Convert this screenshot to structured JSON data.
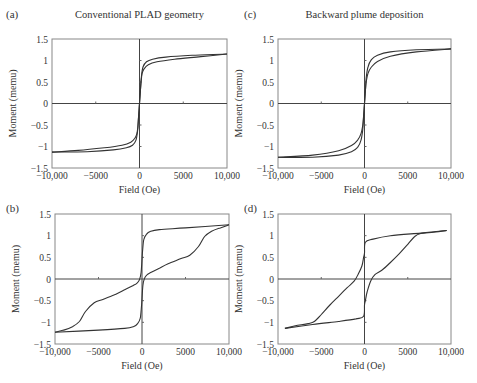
{
  "figure": {
    "panels": [
      {
        "id": "a",
        "letter": "(a)",
        "title": "Conventional PLAD geometry"
      },
      {
        "id": "c",
        "letter": "(c)",
        "title": "Backward plume deposition"
      },
      {
        "id": "b",
        "letter": "(b)",
        "title": ""
      },
      {
        "id": "d",
        "letter": "(d)",
        "title": ""
      }
    ]
  },
  "chart_data": [
    {
      "panel": "(a)",
      "type": "line",
      "title": "Conventional PLAD geometry",
      "xlabel": "Field (Oe)",
      "ylabel": "Moment (memu)",
      "xlim": [
        -10000,
        10000
      ],
      "ylim": [
        -1.5,
        1.5
      ],
      "x_ticks": [
        "-10,000",
        "-5000",
        "0",
        "5000",
        "10,000"
      ],
      "y_ticks": [
        "1.5",
        "1",
        "0.5",
        "0",
        "-0.5",
        "-1",
        "-1.5"
      ],
      "grid": false,
      "series": [
        {
          "name": "descending branch",
          "x": [
            10000,
            6000,
            3000,
            1500,
            800,
            400,
            200,
            100,
            0,
            -100,
            -200,
            -300,
            -500,
            -1000,
            -2000,
            -4000,
            -7000,
            -10000
          ],
          "y": [
            1.15,
            1.12,
            1.08,
            1.03,
            0.97,
            0.85,
            0.6,
            0.3,
            0.0,
            -0.3,
            -0.55,
            -0.7,
            -0.8,
            -0.9,
            -0.97,
            -1.03,
            -1.09,
            -1.13
          ]
        },
        {
          "name": "ascending branch",
          "x": [
            -10000,
            -6000,
            -3000,
            -1500,
            -800,
            -400,
            -200,
            -100,
            0,
            100,
            200,
            300,
            500,
            1000,
            2000,
            4000,
            7000,
            10000
          ],
          "y": [
            -1.13,
            -1.12,
            -1.08,
            -1.03,
            -0.97,
            -0.85,
            -0.6,
            -0.3,
            0.0,
            0.3,
            0.55,
            0.7,
            0.8,
            0.9,
            0.97,
            1.03,
            1.09,
            1.15
          ]
        }
      ]
    },
    {
      "panel": "(c)",
      "type": "line",
      "title": "Backward plume deposition",
      "xlabel": "Field (Oe)",
      "ylabel": "Moment (memu)",
      "xlim": [
        -10000,
        10000
      ],
      "ylim": [
        -1.5,
        1.5
      ],
      "x_ticks": [
        "-10,000",
        "-5000",
        "0",
        "5000",
        "10,000"
      ],
      "y_ticks": [
        "1.5",
        "1",
        "0.5",
        "0",
        "-0.5",
        "-1",
        "-1.5"
      ],
      "grid": false,
      "series": [
        {
          "name": "descending branch",
          "x": [
            10000,
            6000,
            3000,
            1500,
            800,
            400,
            200,
            100,
            0,
            -100,
            -200,
            -400,
            -800,
            -1500,
            -3000,
            -6000,
            -10000
          ],
          "y": [
            1.27,
            1.25,
            1.2,
            1.12,
            1.02,
            0.85,
            0.6,
            0.3,
            0.0,
            -0.3,
            -0.5,
            -0.7,
            -0.85,
            -0.98,
            -1.1,
            -1.2,
            -1.25
          ]
        },
        {
          "name": "ascending branch",
          "x": [
            -10000,
            -6000,
            -3000,
            -1500,
            -800,
            -400,
            -200,
            -100,
            0,
            100,
            200,
            400,
            800,
            1500,
            3000,
            6000,
            10000
          ],
          "y": [
            -1.25,
            -1.25,
            -1.2,
            -1.12,
            -1.02,
            -0.85,
            -0.6,
            -0.3,
            0.0,
            0.3,
            0.5,
            0.7,
            0.85,
            0.98,
            1.1,
            1.2,
            1.27
          ]
        }
      ]
    },
    {
      "panel": "(b)",
      "type": "line",
      "title": "",
      "xlabel": "Field (Oe)",
      "ylabel": "Moment (memu)",
      "xlim": [
        -10000,
        10000
      ],
      "ylim": [
        -1.5,
        1.5
      ],
      "x_ticks": [
        "-10,000",
        "-5000",
        "0",
        "5000",
        "10,000"
      ],
      "y_ticks": [
        "1.5",
        "1",
        "0.5",
        "0",
        "-0.5",
        "-1",
        "-1.5"
      ],
      "grid": false,
      "series": [
        {
          "name": "descending branch",
          "x": [
            10000,
            5000,
            2000,
            1000,
            500,
            200,
            50,
            -100,
            -300,
            -600,
            -1000,
            -2000,
            -3000,
            -4500,
            -5500,
            -6500,
            -7200,
            -8000,
            -9000,
            -10000
          ],
          "y": [
            1.25,
            1.18,
            1.14,
            1.1,
            1.03,
            0.9,
            0.6,
            0.15,
            -0.02,
            -0.1,
            -0.15,
            -0.25,
            -0.35,
            -0.47,
            -0.55,
            -0.75,
            -0.98,
            -1.1,
            -1.18,
            -1.23
          ]
        },
        {
          "name": "ascending branch",
          "x": [
            -10000,
            -5000,
            -2000,
            -1000,
            -500,
            -200,
            -50,
            100,
            300,
            600,
            1000,
            2000,
            3000,
            4500,
            5500,
            6500,
            7200,
            8000,
            9000,
            10000
          ],
          "y": [
            -1.23,
            -1.18,
            -1.14,
            -1.1,
            -1.03,
            -0.9,
            -0.6,
            -0.15,
            0.02,
            0.1,
            0.15,
            0.25,
            0.35,
            0.47,
            0.55,
            0.75,
            0.98,
            1.1,
            1.18,
            1.25
          ]
        }
      ]
    },
    {
      "panel": "(d)",
      "type": "line",
      "title": "",
      "xlabel": "Field (Oe)",
      "ylabel": "Moment (memu)",
      "xlim": [
        -10000,
        10000
      ],
      "ylim": [
        -1.5,
        1.5
      ],
      "x_ticks": [
        "-10,000",
        "-5000",
        "0",
        "5000",
        "10,000"
      ],
      "y_ticks": [
        "1.5",
        "1",
        "0.5",
        "0",
        "-0.5",
        "-1",
        "-1.5"
      ],
      "grid": false,
      "series": [
        {
          "name": "descending branch",
          "x": [
            9500,
            6500,
            3000,
            1000,
            100,
            0,
            -100,
            -300,
            -700,
            -1200,
            -2000,
            -3000,
            -4000,
            -5000,
            -5800,
            -6500,
            -8000,
            -9200
          ],
          "y": [
            1.12,
            1.06,
            1.0,
            0.92,
            0.85,
            0.6,
            0.5,
            0.3,
            0.12,
            -0.05,
            -0.2,
            -0.4,
            -0.6,
            -0.82,
            -0.98,
            -1.03,
            -1.08,
            -1.14
          ]
        },
        {
          "name": "ascending branch",
          "x": [
            -9200,
            -6000,
            -3000,
            -1000,
            -100,
            0,
            100,
            300,
            700,
            1200,
            2000,
            3000,
            4000,
            5000,
            5800,
            6500,
            8000,
            9500
          ],
          "y": [
            -1.14,
            -1.05,
            -0.98,
            -0.92,
            -0.86,
            -0.6,
            -0.5,
            -0.3,
            -0.05,
            0.1,
            0.2,
            0.38,
            0.58,
            0.8,
            0.98,
            1.05,
            1.08,
            1.12
          ]
        }
      ]
    }
  ]
}
